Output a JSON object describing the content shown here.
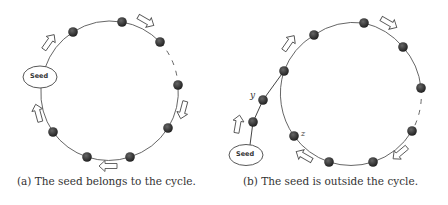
{
  "figure": {
    "panels": [
      {
        "id": "a",
        "caption": "(a) The seed belongs to the cycle.",
        "seed_label": "Seed",
        "node_count": 8,
        "labels": []
      },
      {
        "id": "b",
        "caption": "(b) The seed is outside the cycle.",
        "seed_label": "Seed",
        "node_count": 11,
        "labels": [
          "y",
          "z"
        ]
      }
    ],
    "colors": {
      "node": "#2b2b2b",
      "edge": "#555555",
      "arrow_stroke": "#555555",
      "arrow_fill": "#ffffff"
    }
  }
}
